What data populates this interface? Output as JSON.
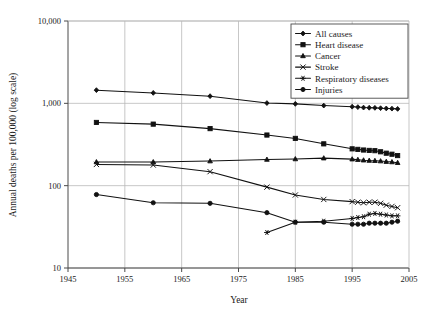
{
  "chart_data": {
    "type": "line",
    "title": "",
    "xlabel": "Year",
    "ylabel": "Annual deaths per 100,000 (log scale)",
    "xlim": [
      1945,
      2005
    ],
    "ylim": [
      10,
      10000
    ],
    "yscale": "log",
    "grid": true,
    "xticks": [
      1945,
      1955,
      1965,
      1975,
      1985,
      1995,
      2005
    ],
    "xtick_labels": [
      "1945",
      "1955",
      "1965",
      "1975",
      "1985",
      "1995",
      "2005"
    ],
    "yticks": [
      10,
      100,
      1000,
      10000
    ],
    "ytick_labels": [
      "10",
      "100",
      "1,000",
      "10,000"
    ],
    "legend_position": "top-right",
    "series": [
      {
        "name": "All causes",
        "marker": "diamond",
        "x": [
          1950,
          1960,
          1970,
          1980,
          1985,
          1990,
          1995,
          1996,
          1997,
          1998,
          1999,
          2000,
          2001,
          2002,
          2003
        ],
        "values": [
          1446,
          1339,
          1222,
          1008,
          985,
          939,
          910,
          900,
          888,
          884,
          881,
          873,
          867,
          862,
          856
        ]
      },
      {
        "name": "Heart disease",
        "marker": "square",
        "x": [
          1950,
          1960,
          1970,
          1980,
          1985,
          1990,
          1995,
          1996,
          1997,
          1998,
          1999,
          2000,
          2001,
          2002,
          2003
        ],
        "values": [
          586,
          559,
          493,
          412,
          375,
          322,
          280,
          276,
          271,
          268,
          266,
          258,
          248,
          241,
          232
        ]
      },
      {
        "name": "Cancer",
        "marker": "triangle",
        "x": [
          1950,
          1960,
          1970,
          1980,
          1985,
          1990,
          1995,
          1996,
          1997,
          1998,
          1999,
          2000,
          2001,
          2002,
          2003
        ],
        "values": [
          194,
          194,
          199,
          208,
          211,
          216,
          210,
          207,
          204,
          202,
          201,
          199,
          196,
          194,
          190
        ]
      },
      {
        "name": "Stroke",
        "marker": "cross",
        "x": [
          1950,
          1960,
          1970,
          1980,
          1985,
          1990,
          1995,
          1996,
          1997,
          1998,
          1999,
          2000,
          2001,
          2002,
          2003
        ],
        "values": [
          181,
          178,
          148,
          96,
          77,
          68,
          64,
          63,
          62,
          63,
          63,
          61,
          58,
          56,
          54
        ]
      },
      {
        "name": "Respiratory diseases",
        "marker": "asterisk",
        "x": [
          1980,
          1985,
          1990,
          1995,
          1996,
          1997,
          1998,
          1999,
          2000,
          2001,
          2002,
          2003
        ],
        "values": [
          27,
          36,
          37,
          40,
          41,
          42,
          45,
          46,
          45,
          44,
          43,
          43
        ]
      },
      {
        "name": "Injuries",
        "marker": "circle",
        "x": [
          1950,
          1960,
          1970,
          1980,
          1985,
          1990,
          1995,
          1996,
          1997,
          1998,
          1999,
          2000,
          2001,
          2002,
          2003
        ],
        "values": [
          78,
          62,
          61,
          47,
          36,
          36,
          34,
          34,
          34,
          35,
          35,
          35,
          35,
          36,
          37
        ]
      }
    ]
  },
  "axes": {
    "x_title": "Year",
    "y_title": "Annual deaths per 100,000 (log scale)"
  },
  "legend": {
    "items": [
      {
        "label": "All causes"
      },
      {
        "label": "Heart disease"
      },
      {
        "label": "Cancer"
      },
      {
        "label": "Stroke"
      },
      {
        "label": "Respiratory diseases"
      },
      {
        "label": "Injuries"
      }
    ]
  }
}
